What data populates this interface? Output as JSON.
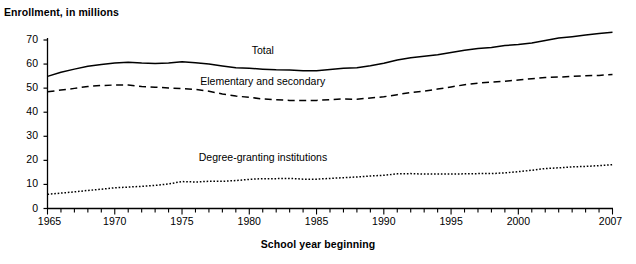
{
  "figure": {
    "title_remnant": "",
    "y_axis_label": "Enrollment, in millions",
    "x_axis_label": "School year beginning"
  },
  "chart_data": {
    "type": "line",
    "title": "",
    "xlabel": "School year beginning",
    "ylabel": "Enrollment, in millions",
    "xlim": [
      1965,
      2007
    ],
    "ylim": [
      0,
      70
    ],
    "grid": false,
    "legend": "inline-labels",
    "x_major_ticks": [
      1965,
      1970,
      1975,
      1980,
      1985,
      1990,
      1995,
      2000,
      2007
    ],
    "x_tick_labels": [
      "1965",
      "1970",
      "1975",
      "1980",
      "1985",
      "1990",
      "1995",
      "2000",
      "2007"
    ],
    "x_minor_tick_interval": 1,
    "y_ticks": [
      0,
      10,
      20,
      30,
      40,
      50,
      60,
      70
    ],
    "y_tick_labels": [
      "0",
      "10",
      "20",
      "30",
      "40",
      "50",
      "60",
      "70"
    ],
    "x": [
      1965,
      1966,
      1967,
      1968,
      1969,
      1970,
      1971,
      1972,
      1973,
      1974,
      1975,
      1976,
      1977,
      1978,
      1979,
      1980,
      1981,
      1982,
      1983,
      1984,
      1985,
      1986,
      1987,
      1988,
      1989,
      1990,
      1991,
      1992,
      1993,
      1994,
      1995,
      1996,
      1997,
      1998,
      1999,
      2000,
      2001,
      2002,
      2003,
      2004,
      2005,
      2006,
      2007
    ],
    "series": [
      {
        "name": "Total",
        "style": "solid",
        "label_text": "Total",
        "values": [
          54.9,
          56.6,
          57.9,
          59.1,
          59.8,
          60.4,
          60.8,
          60.4,
          60.2,
          60.4,
          61.0,
          60.5,
          60.0,
          59.2,
          58.5,
          58.3,
          57.9,
          57.6,
          57.5,
          57.2,
          57.2,
          57.7,
          58.3,
          58.5,
          59.3,
          60.3,
          61.7,
          62.6,
          63.2,
          63.9,
          64.8,
          65.7,
          66.5,
          66.9,
          67.7,
          68.1,
          68.8,
          69.8,
          70.8,
          71.4,
          72.1,
          72.7,
          73.2
        ]
      },
      {
        "name": "Elementary and secondary",
        "style": "dashed",
        "label_text": "Elementary and secondary",
        "values": [
          48.5,
          49.2,
          49.9,
          50.7,
          51.1,
          51.3,
          51.3,
          50.7,
          50.4,
          50.1,
          49.8,
          49.5,
          48.7,
          47.6,
          46.7,
          46.2,
          45.5,
          45.2,
          44.9,
          44.9,
          44.9,
          45.2,
          45.5,
          45.4,
          45.9,
          46.4,
          47.3,
          48.2,
          48.8,
          49.6,
          50.5,
          51.4,
          52.1,
          52.5,
          52.9,
          53.4,
          53.9,
          54.4,
          54.6,
          54.9,
          55.2,
          55.3,
          55.7
        ]
      },
      {
        "name": "Degree-granting institutions",
        "style": "dotted",
        "label_text": "Degree-granting institutions",
        "values": [
          5.9,
          6.4,
          6.9,
          7.5,
          8.0,
          8.6,
          8.9,
          9.2,
          9.6,
          10.2,
          11.2,
          11.0,
          11.3,
          11.3,
          11.6,
          12.1,
          12.4,
          12.4,
          12.5,
          12.2,
          12.2,
          12.5,
          12.8,
          13.1,
          13.5,
          13.8,
          14.4,
          14.5,
          14.3,
          14.3,
          14.3,
          14.4,
          14.5,
          14.5,
          14.8,
          15.3,
          15.9,
          16.6,
          16.9,
          17.3,
          17.5,
          17.8,
          18.2
        ]
      }
    ],
    "annotations": [
      {
        "text": "Total",
        "x": 1981,
        "y": 65.5
      },
      {
        "text": "Elementary and secondary",
        "x": 1981,
        "y": 52.5
      },
      {
        "text": "Degree-granting institutions",
        "x": 1981,
        "y": 21.0
      }
    ]
  }
}
